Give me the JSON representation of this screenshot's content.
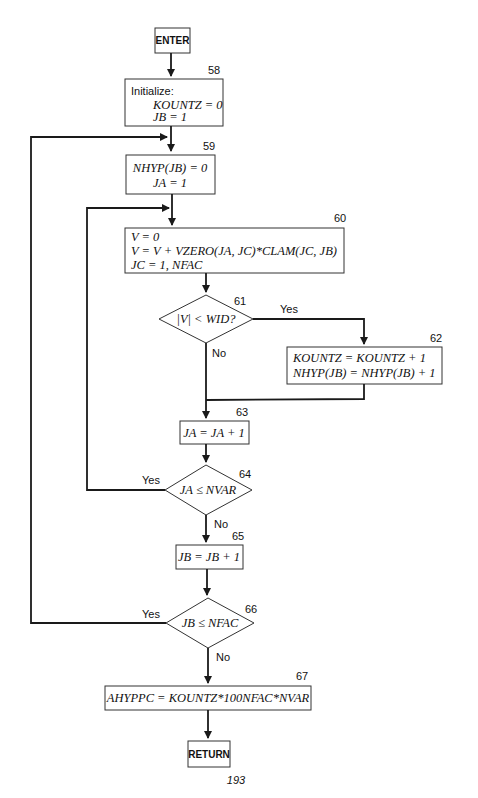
{
  "flowchart": {
    "start": "ENTER",
    "end": "RETURN",
    "page_number": "193",
    "steps": [
      {
        "id": "58",
        "type": "process",
        "title": "Initialize:",
        "lines": [
          "KOUNTZ = 0",
          "JB = 1"
        ]
      },
      {
        "id": "59",
        "type": "process",
        "lines": [
          "NHYP(JB) = 0",
          "JA = 1"
        ]
      },
      {
        "id": "60",
        "type": "process",
        "lines": [
          "V = 0",
          "V = V + VZERO(JA, JC)*CLAM(JC, JB)",
          "JC = 1, NFAC"
        ]
      },
      {
        "id": "61",
        "type": "decision",
        "text": "|V| < WID?",
        "yes": "Yes",
        "no": "No"
      },
      {
        "id": "62",
        "type": "process",
        "lines": [
          "KOUNTZ = KOUNTZ + 1",
          "NHYP(JB) = NHYP(JB) + 1"
        ]
      },
      {
        "id": "63",
        "type": "process",
        "lines": [
          "JA = JA + 1"
        ]
      },
      {
        "id": "64",
        "type": "decision",
        "text": "JA ≤ NVAR",
        "yes": "Yes",
        "no": "No"
      },
      {
        "id": "65",
        "type": "process",
        "lines": [
          "JB = JB + 1"
        ]
      },
      {
        "id": "66",
        "type": "decision",
        "text": "JB ≤ NFAC",
        "yes": "Yes",
        "no": "No"
      },
      {
        "id": "67",
        "type": "process",
        "lines": [
          "AHYPPC = KOUNTZ*100NFAC*NVAR"
        ]
      }
    ]
  }
}
